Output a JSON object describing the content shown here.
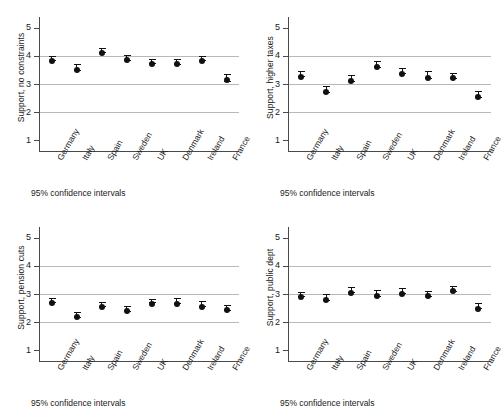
{
  "figure": {
    "background": "#ffffff",
    "marker_color": "#111111",
    "grid_color": "#b8b8b8",
    "axis_color": "#4a4a4a"
  },
  "chart_data": [
    {
      "id": "support-no-constraints",
      "type": "scatter",
      "title": "",
      "ylabel": "Support, no constraints",
      "xlabel": "",
      "caption": "95% confidence intervals",
      "ylim": [
        0.72,
        5.28
      ],
      "yticks": [
        1,
        2,
        3,
        4,
        5
      ],
      "ytick_labels": [
        "1",
        "2",
        "3",
        "4",
        "5"
      ],
      "gridlines": [
        2,
        3,
        4
      ],
      "grid": true,
      "legend": "none",
      "categories": [
        "Germany",
        "Italy",
        "Spain",
        "Sweden",
        "UK",
        "Denmark",
        "Ireland",
        "France"
      ],
      "values": [
        3.93,
        3.61,
        4.22,
        3.95,
        3.82,
        3.81,
        3.94,
        3.24
      ],
      "ci_low": [
        3.87,
        3.49,
        4.15,
        3.85,
        3.75,
        3.73,
        3.87,
        3.12
      ],
      "ci_high": [
        3.99,
        3.73,
        4.29,
        4.05,
        3.89,
        3.89,
        4.01,
        3.36
      ]
    },
    {
      "id": "support-higher-taxes",
      "type": "scatter",
      "title": "",
      "ylabel": "Support, higher taxes",
      "xlabel": "",
      "caption": "95% confidence intervals",
      "ylim": [
        0.72,
        5.28
      ],
      "yticks": [
        1,
        2,
        3,
        4,
        5
      ],
      "ytick_labels": [
        "1",
        "2",
        "3",
        "4",
        "5"
      ],
      "gridlines": [
        2,
        3,
        4
      ],
      "grid": true,
      "legend": "none",
      "categories": [
        "Germany",
        "Italy",
        "Spain",
        "Sweden",
        "UK",
        "Denmark",
        "Ireland",
        "France"
      ],
      "values": [
        3.37,
        2.82,
        3.22,
        3.72,
        3.47,
        3.34,
        3.32,
        2.64
      ],
      "ci_low": [
        3.29,
        2.72,
        3.12,
        3.62,
        3.38,
        3.23,
        3.23,
        2.54
      ],
      "ci_high": [
        3.45,
        2.92,
        3.32,
        3.82,
        3.56,
        3.45,
        3.41,
        2.74
      ]
    },
    {
      "id": "support-pension-cuts",
      "type": "scatter",
      "title": "",
      "ylabel": "Support, pension cuts",
      "xlabel": "",
      "caption": "95% confidence intervals",
      "ylim": [
        0.72,
        5.28
      ],
      "yticks": [
        1,
        2,
        3,
        4,
        5
      ],
      "ytick_labels": [
        "1",
        "2",
        "3",
        "4",
        "5"
      ],
      "gridlines": [
        2,
        3,
        4
      ],
      "grid": true,
      "legend": "none",
      "categories": [
        "Germany",
        "Italy",
        "Spain",
        "Sweden",
        "UK",
        "Denmark",
        "Ireland",
        "France"
      ],
      "values": [
        2.79,
        2.28,
        2.64,
        2.5,
        2.77,
        2.76,
        2.65,
        2.53
      ],
      "ci_low": [
        2.73,
        2.19,
        2.56,
        2.41,
        2.7,
        2.67,
        2.56,
        2.44
      ],
      "ci_high": [
        2.85,
        2.37,
        2.72,
        2.59,
        2.84,
        2.85,
        2.74,
        2.62
      ]
    },
    {
      "id": "support-public-dept",
      "type": "scatter",
      "title": "",
      "ylabel": "Support, public dept",
      "xlabel": "",
      "caption": "95% confidence intervals",
      "ylim": [
        0.72,
        5.28
      ],
      "yticks": [
        1,
        2,
        3,
        4,
        5
      ],
      "ytick_labels": [
        "1",
        "2",
        "3",
        "4",
        "5"
      ],
      "gridlines": [
        2,
        3,
        4
      ],
      "grid": true,
      "legend": "none",
      "categories": [
        "Germany",
        "Italy",
        "Spain",
        "Sweden",
        "UK",
        "Denmark",
        "Ireland",
        "France"
      ],
      "values": [
        2.99,
        2.89,
        3.15,
        3.03,
        3.12,
        3.03,
        3.2,
        2.59
      ],
      "ci_low": [
        2.92,
        2.79,
        3.06,
        2.93,
        3.04,
        2.94,
        3.11,
        2.49
      ],
      "ci_high": [
        3.06,
        2.99,
        3.24,
        3.13,
        3.2,
        3.12,
        3.29,
        2.69
      ]
    }
  ]
}
